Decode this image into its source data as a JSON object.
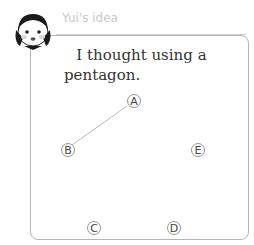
{
  "header": {
    "label": "Yui's idea"
  },
  "body": {
    "line1": "I thought using a",
    "line2": "pentagon."
  },
  "points": [
    {
      "label": "A",
      "x": 94,
      "y": 101
    },
    {
      "label": "B",
      "x": 28,
      "y": 149
    },
    {
      "label": "C",
      "x": 94,
      "y": 228
    },
    {
      "label": "D",
      "x": 174,
      "y": 228
    },
    {
      "label": "E",
      "x": 196,
      "y": 149
    }
  ],
  "segments": [
    {
      "from": "A",
      "to": "B"
    }
  ],
  "colors": {
    "frame": "#b5b5b5",
    "line": "#bbbbbb",
    "label": "#c8c8c8"
  }
}
